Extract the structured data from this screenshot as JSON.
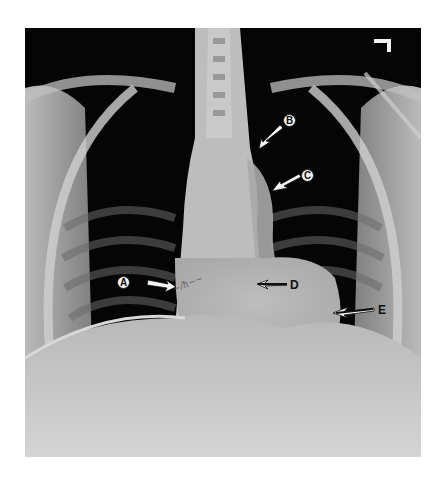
{
  "image": {
    "kind": "frontal chest radiograph (PA view)",
    "side_marker": "L",
    "handwriting": "illegible annotation"
  },
  "annotations": [
    {
      "id": "A",
      "label": "A",
      "arrow_direction": "right",
      "style": "circled"
    },
    {
      "id": "B",
      "label": "B",
      "arrow_direction": "down-left",
      "style": "circled"
    },
    {
      "id": "C",
      "label": "C",
      "arrow_direction": "down-left",
      "style": "circled"
    },
    {
      "id": "D",
      "label": "D",
      "arrow_direction": "left",
      "style": "plain"
    },
    {
      "id": "E",
      "label": "E",
      "arrow_direction": "left",
      "style": "plain"
    }
  ],
  "colors": {
    "film_dark": "#050505",
    "bone": "#d9d9d9",
    "soft_tissue": "#c2c2c2",
    "background": "#ffffff"
  }
}
